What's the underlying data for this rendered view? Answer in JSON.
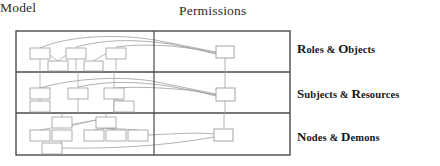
{
  "figure": {
    "background": "#ffffff",
    "frame_color": "#4a4a4a",
    "node_stroke": "#9a9a9a",
    "edge_color": "#9e9e9e",
    "connector_color": "#8a8a8a"
  },
  "columns": {
    "model_label": "Model",
    "permissions_label": "Permissions"
  },
  "rows": [
    {
      "id": "roles-objects",
      "label_lead": "R",
      "label_mid": "oles & ",
      "label_cap2": "O",
      "label_tail": "bjects",
      "label_full": "Roles & Objects"
    },
    {
      "id": "subjects-resources",
      "label_lead": "S",
      "label_mid": "ubjects & ",
      "label_cap2": "R",
      "label_tail": "esources",
      "label_full": "Subjects & Resources"
    },
    {
      "id": "nodes-demons",
      "label_lead": "N",
      "label_mid": "odes & ",
      "label_cap2": "D",
      "label_tail": "emons",
      "label_full": "Nodes & Demons"
    }
  ],
  "diagram": {
    "frame": {
      "x": 16,
      "y": 31,
      "width": 274,
      "height": 124
    },
    "vertical_divider_x": 154,
    "row_dividers_y": [
      72,
      113
    ],
    "model_nodes": [
      {
        "row": 1,
        "x": 30,
        "y": 48,
        "w": 20,
        "h": 11
      },
      {
        "row": 1,
        "x": 66,
        "y": 48,
        "w": 20,
        "h": 11
      },
      {
        "row": 1,
        "x": 106,
        "y": 48,
        "w": 20,
        "h": 11
      },
      {
        "row": 1,
        "x": 48,
        "y": 61,
        "w": 20,
        "h": 10
      },
      {
        "row": 1,
        "x": 84,
        "y": 61,
        "w": 19,
        "h": 10
      },
      {
        "row": 2,
        "x": 30,
        "y": 88,
        "w": 20,
        "h": 11
      },
      {
        "row": 2,
        "x": 68,
        "y": 88,
        "w": 20,
        "h": 11
      },
      {
        "row": 2,
        "x": 104,
        "y": 88,
        "w": 20,
        "h": 11
      },
      {
        "row": 2,
        "x": 30,
        "y": 101,
        "w": 20,
        "h": 11
      },
      {
        "row": 2,
        "x": 114,
        "y": 101,
        "w": 20,
        "h": 11
      },
      {
        "row": 3,
        "x": 52,
        "y": 117,
        "w": 20,
        "h": 11
      },
      {
        "row": 3,
        "x": 96,
        "y": 117,
        "w": 20,
        "h": 11
      },
      {
        "row": 3,
        "x": 30,
        "y": 130,
        "w": 20,
        "h": 11
      },
      {
        "row": 3,
        "x": 52,
        "y": 130,
        "w": 20,
        "h": 11
      },
      {
        "row": 3,
        "x": 84,
        "y": 130,
        "w": 20,
        "h": 11
      },
      {
        "row": 3,
        "x": 106,
        "y": 130,
        "w": 20,
        "h": 11
      },
      {
        "row": 3,
        "x": 128,
        "y": 130,
        "w": 20,
        "h": 11
      },
      {
        "row": 3,
        "x": 42,
        "y": 143,
        "w": 20,
        "h": 11
      }
    ],
    "permission_nodes": [
      {
        "row": 1,
        "x": 216,
        "y": 46,
        "w": 18,
        "h": 12
      },
      {
        "row": 2,
        "x": 216,
        "y": 88,
        "w": 19,
        "h": 13
      },
      {
        "row": 3,
        "x": 214,
        "y": 129,
        "w": 19,
        "h": 12
      }
    ]
  }
}
